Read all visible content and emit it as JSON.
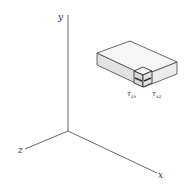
{
  "diagram": {
    "axes": {
      "y_label": "y",
      "z_label": "z",
      "x_label": "x"
    },
    "element": {
      "label_left": "τzx",
      "label_left_base": "τ",
      "label_left_sub": "zx",
      "label_right": "τxz",
      "label_right_base": "τ",
      "label_right_sub": "xz"
    },
    "colors": {
      "axis": "#555555",
      "box_top": "#f4f4f4",
      "box_left": "#e2e2e2",
      "box_right": "#ececec",
      "box_edge": "#444444",
      "cube_face": "#d9d9d9",
      "arrow": "#333333"
    }
  }
}
